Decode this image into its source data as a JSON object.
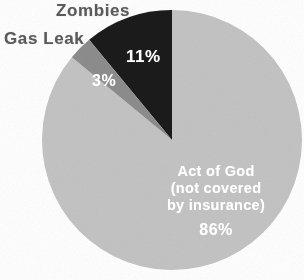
{
  "chart_data": {
    "type": "pie",
    "title": "",
    "subtitle": "",
    "xlabel": "",
    "ylabel": "",
    "legend_position": "none",
    "grid": false,
    "start_angle_deg": 0,
    "direction": "clockwise",
    "categories": [
      "Act of God (not covered by insurance)",
      "Zombies",
      "Gas Leak"
    ],
    "values": [
      86,
      11,
      3
    ],
    "unit": "%",
    "slices": [
      {
        "name": "act-of-god",
        "label": "Act of God",
        "sublabel_line1": "(not covered",
        "sublabel_line2": "by insurance)",
        "value": 86,
        "value_label": "86%",
        "color": "#c4c4c4",
        "label_color": "#ffffff",
        "label_placement": "inside"
      },
      {
        "name": "zombies",
        "label": "Zombies",
        "value": 11,
        "value_label": "11%",
        "color": "#1b1b1b",
        "label_color": "#5a5a5a",
        "label_placement": "outside"
      },
      {
        "name": "gas-leak",
        "label": "Gas Leak",
        "value": 3,
        "value_label": "3%",
        "color": "#8d8d8d",
        "label_color": "#5a5a5a",
        "label_placement": "outside"
      }
    ],
    "annotations": []
  },
  "labels": {
    "zombies": "Zombies",
    "gas_leak": "Gas Leak",
    "pct_zombies": "11%",
    "pct_gas_leak": "3%",
    "main_line1": "Act of God",
    "main_line2": "(not covered",
    "main_line3": "by insurance)",
    "main_pct": "86%"
  },
  "colors": {
    "background": "#ffffff",
    "slice_act_of_god": "#c4c4c4",
    "slice_zombies": "#1b1b1b",
    "slice_gas_leak": "#8d8d8d",
    "outside_label_text": "#5a5a5a",
    "inside_label_text": "#ffffff"
  },
  "geometry": {
    "center_x": 172,
    "center_y": 140,
    "radius": 130
  }
}
